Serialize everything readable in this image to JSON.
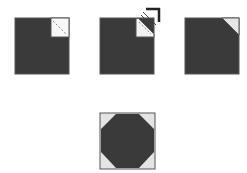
{
  "diagram": {
    "colors": {
      "dark_fabric": "#3a3a3a",
      "light_fabric": "#f2f2f2",
      "corner_shade": "#dcdcdc",
      "outline": "#555555",
      "stitch_line": "#888888"
    },
    "steps": [
      {
        "id": "step-1",
        "description": "Light square placed on corner with diagonal stitch line"
      },
      {
        "id": "step-2",
        "description": "Trim corner; fold arrow showing direction"
      },
      {
        "id": "step-3",
        "description": "Corner pressed to form triangle"
      },
      {
        "id": "step-4",
        "description": "Finished snowball block with four corner triangles"
      }
    ]
  }
}
